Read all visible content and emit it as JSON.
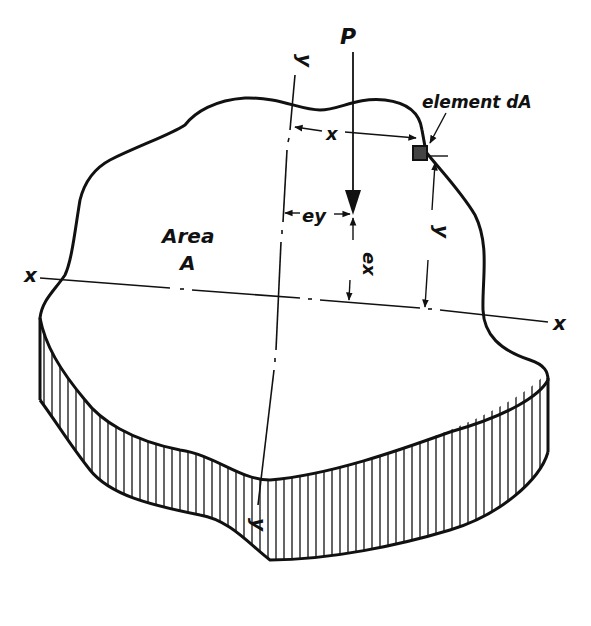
{
  "diagram": {
    "type": "engineering-section-diagram",
    "colors": {
      "ink": "#111111",
      "background": "#ffffff"
    },
    "labels": {
      "load": "P",
      "element": "element dA",
      "area_line1": "Area",
      "area_line2": "A",
      "x_axis_left": "x",
      "x_axis_right": "x",
      "y_axis_top": "y",
      "y_axis_bottom": "y",
      "dim_x": "x",
      "dim_y": "y",
      "ecc_y": "ey",
      "ecc_x": "ex"
    }
  }
}
